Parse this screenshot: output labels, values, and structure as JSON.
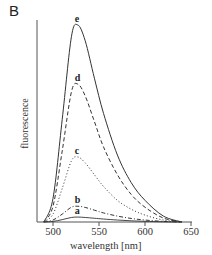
{
  "chart_data": {
    "type": "line",
    "panel_label": "B",
    "title": "",
    "xlabel": "wavelength [nm]",
    "ylabel": "fluorescence",
    "xlim": [
      480,
      650
    ],
    "ylim": [
      0,
      105
    ],
    "xticks": [
      500,
      550,
      600,
      650
    ],
    "yticks": [],
    "grid": false,
    "legend": "inline curve labels at peaks",
    "x": [
      490,
      500,
      510,
      520,
      527,
      535,
      545,
      555,
      570,
      585,
      600,
      620,
      640
    ],
    "series": [
      {
        "name": "a",
        "style": "solid",
        "peak_nm": 527,
        "values": [
          0,
          0.3,
          1.2,
          2.3,
          2.5,
          2.3,
          1.9,
          1.5,
          1.0,
          0.6,
          0.35,
          0.1,
          0
        ]
      },
      {
        "name": "b",
        "style": "dash-dot",
        "peak_nm": 527,
        "values": [
          0,
          1,
          4,
          7.5,
          8,
          7.4,
          6,
          4.6,
          3,
          1.8,
          1,
          0.3,
          0
        ]
      },
      {
        "name": "c",
        "style": "dotted",
        "peak_nm": 527,
        "values": [
          0,
          4,
          17,
          31,
          33,
          30,
          24,
          18,
          11,
          6.5,
          3.5,
          1,
          0
        ]
      },
      {
        "name": "d",
        "style": "dashed",
        "peak_nm": 527,
        "values": [
          0,
          8,
          36,
          66,
          70,
          64,
          51,
          38,
          24,
          14,
          7.5,
          2,
          0
        ]
      },
      {
        "name": "e",
        "style": "solid",
        "peak_nm": 527,
        "values": [
          0,
          12,
          52,
          94,
          100,
          92,
          73,
          55,
          34,
          20,
          11,
          3,
          0
        ]
      }
    ]
  },
  "labels": {
    "panel": "B",
    "xlabel": "wavelength [nm]",
    "ylabel": "fluorescence",
    "ticks": [
      "500",
      "550",
      "600",
      "650"
    ]
  }
}
